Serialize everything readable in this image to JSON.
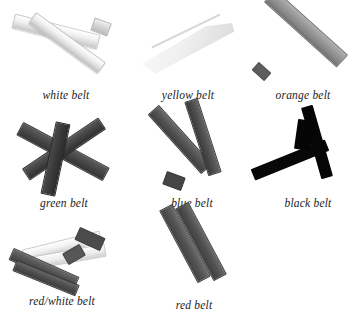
{
  "figure": {
    "background_color": "#ffffff",
    "caption_color": "#1c1c1c",
    "columns": 3,
    "rows": 3
  },
  "belts": [
    {
      "id": "white-belt",
      "label": "white belt",
      "row": 1,
      "column": 1,
      "tone": "very light / near-white",
      "swatch_hex": "#f0f0f0",
      "form": "two pale straps folded together, tips meeting upper-right"
    },
    {
      "id": "yellow-belt",
      "label": "yellow belt",
      "row": 1,
      "column": 2,
      "tone": "light gray",
      "swatch_hex": "#eaeaea",
      "form": "folded tapered wedge, wide at lower-left"
    },
    {
      "id": "orange-belt",
      "label": "orange belt",
      "row": 1,
      "column": 3,
      "tone": "medium gray",
      "swatch_hex": "#8f8f8f",
      "form": "single straight diagonal bar, lower-left to upper-right"
    },
    {
      "id": "green-belt",
      "label": "green belt",
      "row": 2,
      "column": 1,
      "tone": "dark gray",
      "swatch_hex": "#3f3f3f",
      "form": "two straps crossing in an X with a vertical strand"
    },
    {
      "id": "blue-belt",
      "label": "blue belt",
      "row": 2,
      "column": 2,
      "tone": "dark gray",
      "swatch_hex": "#4a4a4a",
      "form": "strap folded into a narrow V / Z shape"
    },
    {
      "id": "black-belt",
      "label": "black belt",
      "row": 2,
      "column": 3,
      "tone": "black",
      "swatch_hex": "#070707",
      "form": "inverted V, thick knotted end at top right"
    },
    {
      "id": "red-white-belt",
      "label": "red/white belt",
      "row": 3,
      "column": 1,
      "tone": "mixed light and dark",
      "swatch_hex": "#9c9c9c",
      "form": "pale straps crossing over darker straps"
    },
    {
      "id": "red-belt",
      "label": "red belt",
      "row": 3,
      "column": 2,
      "tone": "dark gray",
      "swatch_hex": "#4f4f4f",
      "form": "two parallel straps angled steeply upward to the right"
    }
  ]
}
